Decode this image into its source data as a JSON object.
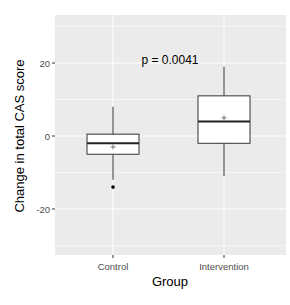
{
  "chart_data": {
    "type": "boxplot",
    "title": "",
    "annotation": "p = 0.0041",
    "xlabel": "Group",
    "ylabel": "Change in total CAS score",
    "categories": [
      "Control",
      "Intervention"
    ],
    "yticks": [
      -20,
      0,
      20
    ],
    "ytick_labels": [
      "-20",
      "0",
      "20"
    ],
    "ylim": [
      -33,
      33
    ],
    "grid": true,
    "panel_background": "#ebebeb",
    "grid_color": "#ffffff",
    "series": [
      {
        "name": "Control",
        "whisker_low": -12,
        "q1": -5,
        "median": -2,
        "q3": 0.5,
        "whisker_high": 8,
        "mean": -3,
        "outliers": [
          -14
        ]
      },
      {
        "name": "Intervention",
        "whisker_low": -11,
        "q1": -2,
        "median": 4,
        "q3": 11,
        "whisker_high": 19,
        "mean": 5,
        "outliers": []
      }
    ]
  }
}
